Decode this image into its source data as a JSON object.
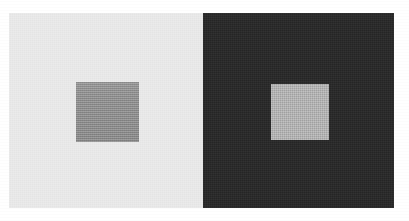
{
  "figure": {
    "page_background": "#ffffff",
    "plate": {
      "x": 9,
      "y": 13,
      "width": 385,
      "height": 195
    },
    "panels": [
      {
        "name": "light-surround-panel",
        "label": "Light surround",
        "background_color": "#e8e8e8",
        "width": 194,
        "patch": {
          "name": "gray-test-patch-on-light",
          "label": "Gray test patch",
          "color": "#919191",
          "x": 67,
          "y": 69,
          "width": 63,
          "height": 60
        }
      },
      {
        "name": "dark-surround-panel",
        "label": "Dark surround",
        "background_color": "#2b2b2b",
        "width": 191,
        "patch": {
          "name": "gray-test-patch-on-dark",
          "label": "Gray test patch",
          "color": "#b2b2b2",
          "x": 68,
          "y": 71,
          "width": 58,
          "height": 56
        }
      }
    ]
  }
}
